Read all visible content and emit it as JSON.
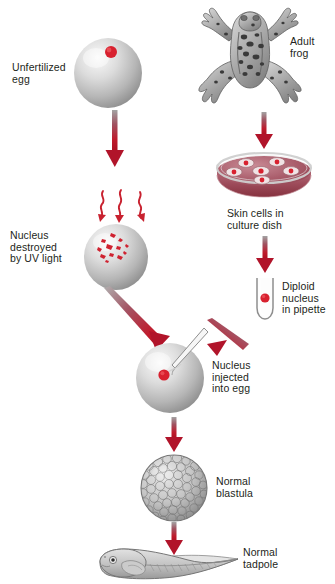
{
  "diagram": {
    "domain_note": "biology process diagram",
    "colors": {
      "arrow_red": "#c0162a",
      "arrow_gray": "#9b9b9b",
      "nucleus_red": "#d8212f",
      "cell_gray_light": "#e6e6e6",
      "cell_gray_dark": "#8c8c8c",
      "dish_medium": "#a8505f",
      "text": "#231f20",
      "frog_body": "#a6a6a6",
      "background": "#ffffff"
    }
  },
  "labels": {
    "unfertilized_egg": "Unfertilized\negg",
    "adult_frog": "Adult\nfrog",
    "nucleus_destroyed": "Nucleus\ndestroyed\nby UV light",
    "skin_cells": "Skin cells in\nculture dish",
    "diploid_nucleus": "Diploid\nnucleus\nin pipette",
    "nucleus_injected": "Nucleus\ninjected\ninto egg",
    "normal_blastula": "Normal\nblastula",
    "normal_tadpole": "Normal\ntadpole"
  },
  "elements": {
    "egg_unfertilized": {
      "nucleus_count": 1
    },
    "egg_uv_damaged": {
      "nucleus_fragments": 12
    },
    "culture_dish": {
      "skin_cell_count": 6
    },
    "pipette": {
      "nucleus_count": 1
    },
    "egg_injected": {
      "nucleus_count": 1
    },
    "blastula": {
      "appearance": "many small cells"
    },
    "tadpole": {
      "appearance": "head with eye and long finned tail"
    }
  },
  "arrows": [
    {
      "id": "egg-down",
      "from": "unfertilized egg",
      "to": "UV exposure"
    },
    {
      "id": "frog-down",
      "from": "adult frog",
      "to": "culture dish"
    },
    {
      "id": "dish-down",
      "from": "culture dish",
      "to": "pipette"
    },
    {
      "id": "uv-egg-diagonal",
      "from": "UV destroyed egg",
      "to": "injection egg"
    },
    {
      "id": "pipette-diagonal",
      "from": "pipette",
      "to": "injection egg"
    },
    {
      "id": "injected-down",
      "from": "injected egg",
      "to": "blastula"
    },
    {
      "id": "blastula-down",
      "from": "blastula",
      "to": "tadpole"
    }
  ],
  "uv_rays": {
    "count": 3,
    "style": "wavy red squiggles"
  }
}
